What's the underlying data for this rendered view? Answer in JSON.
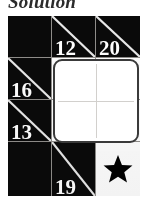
{
  "title": "Solution",
  "puzzle": {
    "type": "kakuro-style-clue-grid",
    "rows": 4,
    "cols": 3,
    "cells": [
      {
        "id": "r1c1",
        "kind": "black",
        "clue": "",
        "diagonal": false,
        "star": false
      },
      {
        "id": "r1c2",
        "kind": "clue",
        "clue": "12",
        "diagonal": true,
        "star": false
      },
      {
        "id": "r1c3",
        "kind": "clue",
        "clue": "20",
        "diagonal": true,
        "star": false
      },
      {
        "id": "r2c1",
        "kind": "clue",
        "clue": "16",
        "diagonal": true,
        "star": false
      },
      {
        "id": "r2c2",
        "kind": "answer",
        "clue": "",
        "diagonal": false,
        "star": false
      },
      {
        "id": "r2c3",
        "kind": "answer",
        "clue": "",
        "diagonal": false,
        "star": false
      },
      {
        "id": "r3c1",
        "kind": "clue",
        "clue": "13",
        "diagonal": true,
        "star": false
      },
      {
        "id": "r3c2",
        "kind": "answer",
        "clue": "",
        "diagonal": false,
        "star": false
      },
      {
        "id": "r3c3",
        "kind": "answer",
        "clue": "",
        "diagonal": false,
        "star": false
      },
      {
        "id": "r4c1",
        "kind": "black",
        "clue": "",
        "diagonal": false,
        "star": false
      },
      {
        "id": "r4c2",
        "kind": "clue",
        "clue": "19",
        "diagonal": true,
        "star": false
      },
      {
        "id": "r4c3",
        "kind": "white-star",
        "clue": "",
        "diagonal": false,
        "star": true
      }
    ],
    "clues": [
      "12",
      "20",
      "16",
      "13",
      "19"
    ],
    "star_glyph": "star-5-point",
    "colors": {
      "black_cell": "#0a0a0a",
      "white_cell": "#ffffff",
      "diagonal": "#e8e8e8",
      "clue_text": "#ffffff",
      "grid_line": "#8f8d8a",
      "answer_border": "#3a3a3a",
      "answer_inner_line": "#d2d0cd",
      "star_fill": "#000000",
      "page_background": "#ffffff"
    }
  }
}
